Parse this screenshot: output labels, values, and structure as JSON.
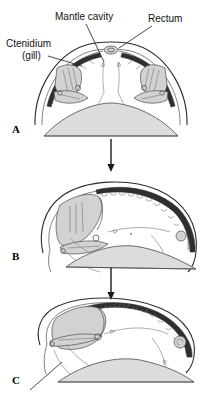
{
  "figure": {
    "background_color": "#ffffff",
    "line_color": "#2b2b2b",
    "shade_color": "#dcdcdc"
  },
  "labels": {
    "mantle_cavity": "Mantle cavity",
    "rectum": "Rectum",
    "ctenidium": "Ctenidium",
    "ctenidium_sub": "(gill)",
    "foot": "Foot"
  },
  "panels": [
    {
      "id": "A",
      "label": "A",
      "caption": ""
    },
    {
      "id": "B",
      "label": "B",
      "caption": ""
    },
    {
      "id": "C",
      "label": "C",
      "caption": ""
    }
  ],
  "icons": {
    "step_arrow": "down-arrow-icon",
    "flow_arrow": "water-flow-arrow-icon",
    "leader_line": "leader-line-icon"
  }
}
